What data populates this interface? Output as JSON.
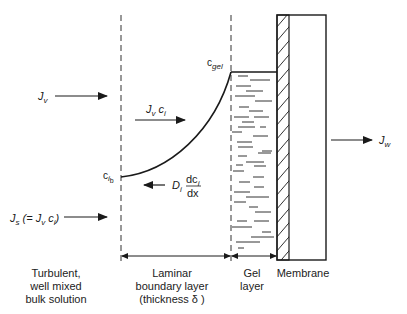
{
  "diagram": {
    "colors": {
      "line": "#1a1a1a",
      "background": "#ffffff"
    },
    "flux_labels": {
      "jv": {
        "main": "J",
        "sub": "v"
      },
      "jv_ci": {
        "main1": "J",
        "sub1": "v",
        "main2": " c",
        "sub2": "i"
      },
      "js": {
        "main": "J",
        "sub": "s",
        "rest1": " (= J",
        "sub2": "v",
        "rest2": " c",
        "sub3": "i",
        "rest3": ")"
      },
      "jw": {
        "main": "J",
        "sub": "w"
      },
      "diffusion": {
        "main": "D",
        "sub": "i",
        "num": "dc",
        "num_sub": "i",
        "den": "dx"
      }
    },
    "concentration_labels": {
      "c_gel": {
        "main": "c",
        "sub": "gel"
      },
      "c_b": {
        "main": "c",
        "sub": "i",
        "subsub": "b"
      }
    },
    "region_labels": {
      "bulk": [
        "Turbulent,",
        "well mixed",
        "bulk solution"
      ],
      "boundary": [
        "Laminar",
        "boundary layer",
        "(thickness δ )"
      ],
      "gel": [
        "Gel",
        "layer"
      ],
      "membrane": [
        "Membrane"
      ]
    }
  }
}
